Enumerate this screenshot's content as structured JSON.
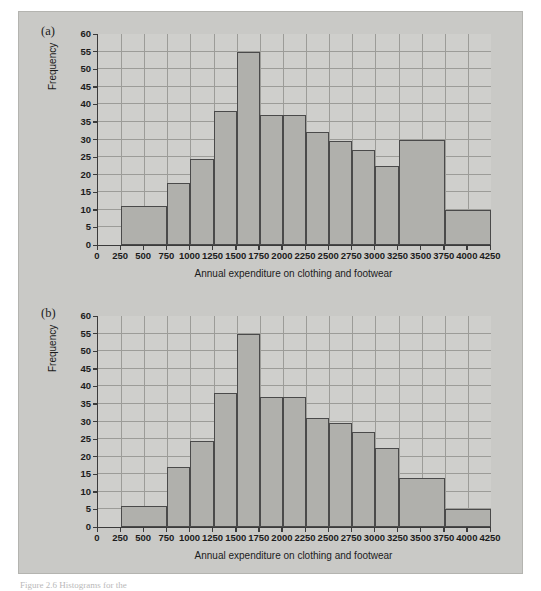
{
  "figure": {
    "panel_labels": [
      "(a)",
      "(b)"
    ],
    "caption": "Figure 2.6  Histograms for the",
    "colors": {
      "page_background": "#ffffff",
      "figure_background": "#c9c9c6",
      "plot_background": "#cfcfcc",
      "bar_fill": "#b0b0ac",
      "bar_edge": "#4a4a4a",
      "gridline": "#9c9c98",
      "axis": "#3b3b3b",
      "text": "#1b1b1b"
    }
  },
  "axes": {
    "xlabel": "Annual expenditure on clothing and footwear",
    "ylabel": "Frequency",
    "xticks": [
      0,
      250,
      500,
      750,
      1000,
      1250,
      1500,
      1750,
      2000,
      2250,
      2500,
      2750,
      3000,
      3250,
      3500,
      3750,
      4000,
      4250
    ],
    "yticks": [
      0,
      5,
      10,
      15,
      20,
      25,
      30,
      35,
      40,
      45,
      50,
      55,
      60
    ],
    "xlim": [
      0,
      4250
    ],
    "ylim": [
      0,
      60
    ],
    "grid": "on"
  },
  "chart_data": [
    {
      "type": "bar",
      "panel": "(a)",
      "title": "",
      "xlabel": "Annual expenditure on clothing and footwear",
      "ylabel": "Frequency",
      "xlim": [
        0,
        4250
      ],
      "ylim": [
        0,
        60
      ],
      "grid": "on",
      "legend": "none",
      "bin_width": 250,
      "bin_edges": [
        250,
        500,
        750,
        1000,
        1250,
        1500,
        1750,
        2000,
        2250,
        2500,
        2750,
        3000,
        3250,
        3750,
        4250
      ],
      "categories": [
        "250-750",
        "750-1000",
        "1000-1250",
        "1250-1500",
        "1500-1750",
        "1750-2000",
        "2000-2250",
        "2250-2500",
        "2500-2750",
        "2750-3000",
        "3000-3250",
        "3250-3750",
        "3750-4250"
      ],
      "values": [
        11,
        17.5,
        24.5,
        38,
        55,
        37,
        37,
        32,
        29.5,
        27,
        22.5,
        30,
        10
      ],
      "bars": [
        {
          "start": 250,
          "end": 750,
          "value": 11
        },
        {
          "start": 750,
          "end": 1000,
          "value": 17.5
        },
        {
          "start": 1000,
          "end": 1250,
          "value": 24.5
        },
        {
          "start": 1250,
          "end": 1500,
          "value": 38
        },
        {
          "start": 1500,
          "end": 1750,
          "value": 55
        },
        {
          "start": 1750,
          "end": 2000,
          "value": 37
        },
        {
          "start": 2000,
          "end": 2250,
          "value": 37
        },
        {
          "start": 2250,
          "end": 2500,
          "value": 32
        },
        {
          "start": 2500,
          "end": 2750,
          "value": 29.5
        },
        {
          "start": 2750,
          "end": 3000,
          "value": 27
        },
        {
          "start": 3000,
          "end": 3250,
          "value": 22.5
        },
        {
          "start": 3250,
          "end": 3750,
          "value": 30
        },
        {
          "start": 3750,
          "end": 4250,
          "value": 10
        }
      ]
    },
    {
      "type": "bar",
      "panel": "(b)",
      "title": "",
      "xlabel": "Annual expenditure on clothing and footwear",
      "ylabel": "Frequency",
      "xlim": [
        0,
        4250
      ],
      "ylim": [
        0,
        60
      ],
      "grid": "on",
      "legend": "none",
      "bin_width": 250,
      "bin_edges": [
        250,
        750,
        1000,
        1250,
        1500,
        1750,
        2000,
        2250,
        2500,
        2750,
        3000,
        3250,
        3750,
        4250
      ],
      "categories": [
        "250-750",
        "750-1000",
        "1000-1250",
        "1250-1500",
        "1500-1750",
        "1750-2000",
        "2000-2250",
        "2250-2500",
        "2500-2750",
        "2750-3000",
        "3000-3250",
        "3250-3750",
        "3750-4250"
      ],
      "values": [
        6,
        17,
        24.5,
        38,
        55,
        37,
        37,
        31,
        29.5,
        27,
        22.5,
        14,
        5
      ],
      "bars": [
        {
          "start": 250,
          "end": 750,
          "value": 6
        },
        {
          "start": 750,
          "end": 1000,
          "value": 17
        },
        {
          "start": 1000,
          "end": 1250,
          "value": 24.5
        },
        {
          "start": 1250,
          "end": 1500,
          "value": 38
        },
        {
          "start": 1500,
          "end": 1750,
          "value": 55
        },
        {
          "start": 1750,
          "end": 2000,
          "value": 37
        },
        {
          "start": 2000,
          "end": 2250,
          "value": 37
        },
        {
          "start": 2250,
          "end": 2500,
          "value": 31
        },
        {
          "start": 2500,
          "end": 2750,
          "value": 29.5
        },
        {
          "start": 2750,
          "end": 3000,
          "value": 27
        },
        {
          "start": 3000,
          "end": 3250,
          "value": 22.5
        },
        {
          "start": 3250,
          "end": 3750,
          "value": 14
        },
        {
          "start": 3750,
          "end": 4250,
          "value": 5
        }
      ]
    }
  ]
}
